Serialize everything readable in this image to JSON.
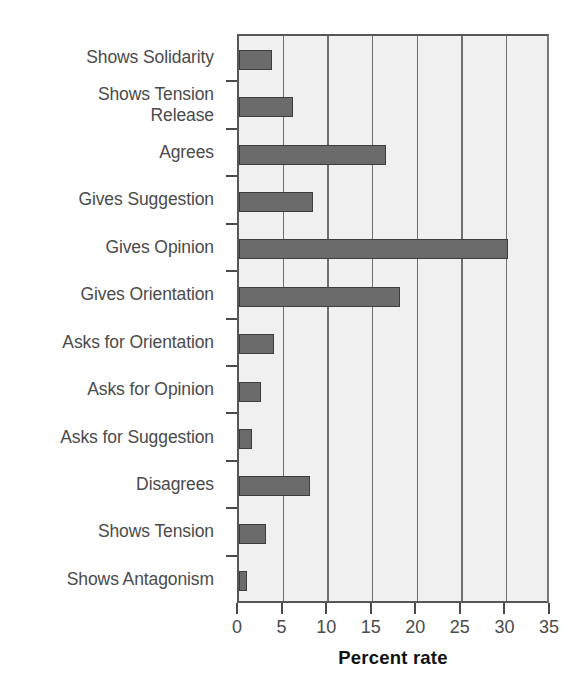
{
  "chart_data": {
    "type": "bar",
    "orientation": "horizontal",
    "title": "",
    "xlabel": "Percent rate",
    "ylabel": "",
    "xlim": [
      0,
      35
    ],
    "xticks": [
      0,
      5,
      10,
      15,
      20,
      25,
      30,
      35
    ],
    "grid": true,
    "legend": false,
    "bar_color": "#6b6b6b",
    "bar_edge_color": "#3d3d3d",
    "plot_background": "#f0f0f0",
    "categories": [
      "Shows Solidarity",
      "Shows Tension\nRelease",
      "Agrees",
      "Gives Suggestion",
      "Gives Opinion",
      "Gives Orientation",
      "Asks for Orientation",
      "Asks for Opinion",
      "Asks for Suggestion",
      "Disagrees",
      "Shows Tension",
      "Shows Antagonism"
    ],
    "values": [
      3.7,
      6.1,
      16.5,
      8.3,
      30.2,
      18.1,
      3.9,
      2.5,
      1.5,
      8.0,
      3.0,
      0.9
    ]
  }
}
